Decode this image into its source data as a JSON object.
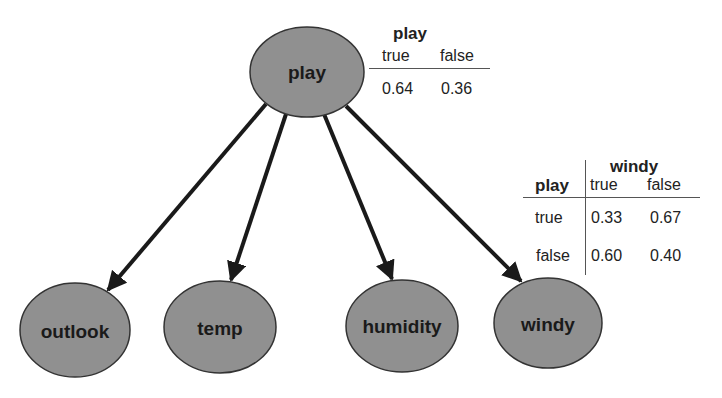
{
  "colors": {
    "node_fill": "#909090",
    "node_stroke": "#333333",
    "edge": "#1a1a1a",
    "background": "#ffffff"
  },
  "nodes": [
    {
      "id": "play",
      "label": "play",
      "cx": 307,
      "cy": 72,
      "rx": 57,
      "ry": 45
    },
    {
      "id": "outlook",
      "label": "outlook",
      "cx": 75,
      "cy": 330,
      "rx": 55,
      "ry": 47
    },
    {
      "id": "temp",
      "label": "temp",
      "cx": 220,
      "cy": 327,
      "rx": 56,
      "ry": 46
    },
    {
      "id": "humidity",
      "label": "humidity",
      "cx": 402,
      "cy": 326,
      "rx": 56,
      "ry": 46
    },
    {
      "id": "windy",
      "label": "windy",
      "cx": 548,
      "cy": 323,
      "rx": 54,
      "ry": 45
    }
  ],
  "edges": [
    {
      "from": "play",
      "to": "outlook"
    },
    {
      "from": "play",
      "to": "temp"
    },
    {
      "from": "play",
      "to": "humidity"
    },
    {
      "from": "play",
      "to": "windy"
    }
  ],
  "play_cpt": {
    "title": "play",
    "columns": [
      "true",
      "false"
    ],
    "values": [
      "0.64",
      "0.36"
    ]
  },
  "windy_cpt": {
    "title": "windy",
    "row_header": "play",
    "columns": [
      "true",
      "false"
    ],
    "rows": [
      {
        "label": "true",
        "values": [
          "0.33",
          "0.67"
        ]
      },
      {
        "label": "false",
        "values": [
          "0.60",
          "0.40"
        ]
      }
    ]
  }
}
